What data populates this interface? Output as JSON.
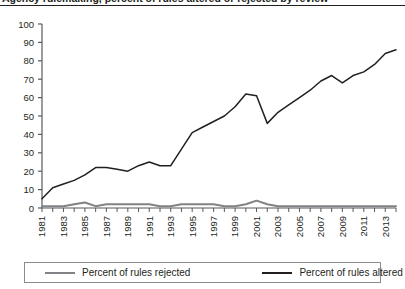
{
  "figure": {
    "title_partial": "Agency rulemaking, percent of rules altered or rejected by review",
    "title_clipped": true
  },
  "legend": {
    "position": "bottom",
    "items": [
      {
        "label": "Percent of rules rejected",
        "color": "#808285",
        "name": "legend-item-rejected"
      },
      {
        "label": "Percent of rules altered",
        "color": "#231f20",
        "name": "legend-item-altered"
      }
    ]
  },
  "axes": {
    "y_ticks": [
      "0",
      "10",
      "20",
      "30",
      "40",
      "50",
      "60",
      "70",
      "80",
      "90",
      "100"
    ],
    "x_ticks": [
      "1981",
      "1983",
      "1985",
      "1987",
      "1989",
      "1991",
      "1993",
      "1995",
      "1997",
      "1999",
      "2001",
      "2003",
      "2005",
      "2007",
      "2009",
      "2011",
      "2013"
    ]
  },
  "chart_data": {
    "type": "line",
    "title": "Agency rulemaking, percent of rules altered or rejected by review",
    "xlabel": "",
    "ylabel": "",
    "ylim": [
      0,
      100
    ],
    "ytick_step": 10,
    "grid": false,
    "legend_position": "bottom",
    "x": [
      1981,
      1982,
      1983,
      1984,
      1985,
      1986,
      1987,
      1988,
      1989,
      1990,
      1991,
      1992,
      1993,
      1994,
      1995,
      1996,
      1997,
      1998,
      1999,
      2000,
      2001,
      2002,
      2003,
      2004,
      2005,
      2006,
      2007,
      2008,
      2009,
      2010,
      2011,
      2012,
      2013,
      2014
    ],
    "series": [
      {
        "name": "Percent of rules altered",
        "color": "#231f20",
        "values": [
          5,
          11,
          13,
          15,
          18,
          22,
          22,
          21,
          20,
          23,
          25,
          23,
          23,
          32,
          41,
          44,
          47,
          50,
          55,
          62,
          61,
          46,
          52,
          56,
          60,
          64,
          69,
          72,
          68,
          72,
          74,
          78,
          84,
          86
        ]
      },
      {
        "name": "Percent of rules rejected",
        "color": "#808285",
        "values": [
          1,
          1,
          1,
          2,
          3,
          1,
          2,
          2,
          2,
          2,
          2,
          1,
          1,
          2,
          2,
          2,
          2,
          1,
          1,
          2,
          4,
          2,
          1,
          1,
          1,
          1,
          1,
          1,
          1,
          1,
          1,
          1,
          1,
          1
        ]
      }
    ]
  }
}
